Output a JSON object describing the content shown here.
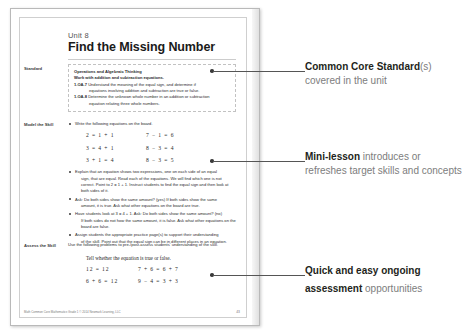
{
  "page": {
    "unit_label": "Unit 8",
    "title": "Find the Missing Number",
    "margin_labels": {
      "standard": "Standard",
      "model": "Model the Skill",
      "assess": "Assess the Skill"
    },
    "standard_box": {
      "domain": "Operations and Algebraic Thinking",
      "cluster": "Work with addition and subtraction equations.",
      "items": [
        {
          "code": "1.OA.7",
          "text": "Understand the meaning of the equal sign, and determine if",
          "continuation": "equations involving addition and subtraction are true or false."
        },
        {
          "code": "1.OA.8",
          "text": "Determine the unknown whole number in an addition or subtraction",
          "continuation": "equation relating three whole numbers."
        }
      ]
    },
    "model_section": {
      "bullets": [
        {
          "text": "Write the following equations on the board.",
          "continuation": ""
        },
        {
          "text": "Explain that an equation shows two expressions, one on each side of an equal",
          "continuation": "sign, that are equal. Read each of the equations. We will find which one is not correct. Point to 2 = 1 + 1. Instruct students to find the equal sign and then look at both sides of it."
        },
        {
          "text": "Ask: Do both sides show the same amount? (yes) If both sides show the same",
          "continuation": "amount, it is true. Ask what other equations on the board are true."
        },
        {
          "text": "Have students look at 3 = 4 + 1. Ask: Do both sides show the same amount? (no)",
          "continuation": "If both sides do not how the same amount, it is false. Ask what other equations on the board are false."
        },
        {
          "text": "Assign students the appropriate practice page(s) to support their understanding",
          "continuation": "of the skill. Point out that the equal sign can be in different places in an equation."
        }
      ],
      "equations": [
        "2 = 1 + 1",
        "7 − 1 = 6",
        "3 = 4 + 1",
        "8 − 3 = 4",
        "3 + 1 = 4",
        "8 − 3 = 5"
      ]
    },
    "assess_section": {
      "intro": "Use the following problems to pre-/post-assess students' understanding of the skill.",
      "prompt": "Tell whether the equation is true or false.",
      "equations": [
        "12 = 12",
        "7 + 6 = 6 + 7",
        "6 + 6 = 12",
        "9 − 4 = 3 + 3"
      ]
    },
    "footer": {
      "credit": "Math Common Core Mathematics Grade 1 © 2014 Newmark Learning, LLC",
      "folio": "43"
    }
  },
  "callouts": [
    {
      "bold": "Common Core Standard",
      "light_inline": "(s)",
      "line2": "covered in the unit"
    },
    {
      "bold": "Mini-lesson",
      "light_inline": " introduces or",
      "line2": "refreshes target skills and concepts"
    },
    {
      "bold": "Quick and easy ongoing",
      "light_inline": "",
      "line2": "assessment opportunities"
    }
  ],
  "callout3": {
    "bold_line1": "Quick and easy ongoing",
    "bold_line2": "assessment",
    "light_line2": " opportunities"
  },
  "colors": {
    "page_border": "#b9b9b9",
    "leader": "#555555",
    "callout_bold": "#231f20",
    "callout_light": "#7d7d7d"
  }
}
